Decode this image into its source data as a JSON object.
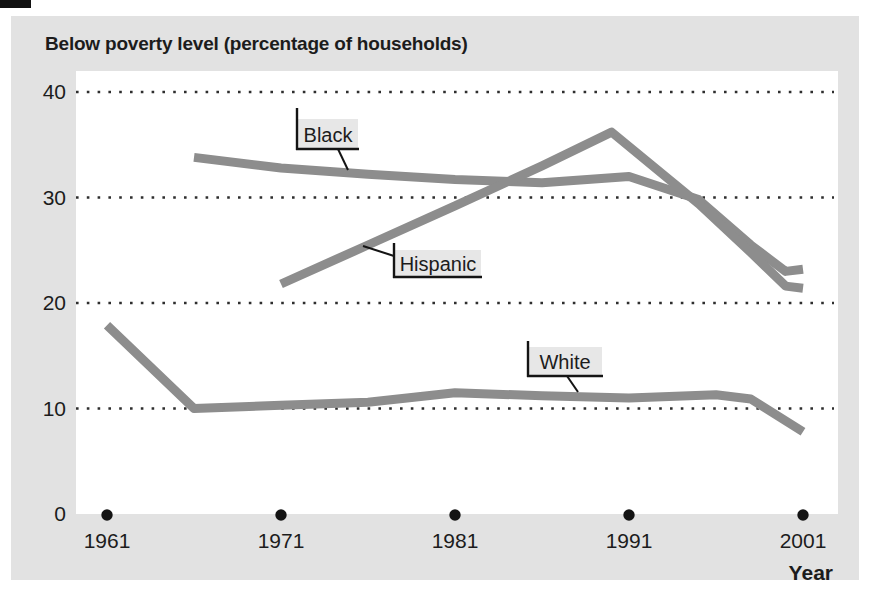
{
  "title": "Below poverty level (percentage of households)",
  "x_axis_label": "Year",
  "colors": {
    "panel_bg": "#e2e2e2",
    "plot_bg": "#ffffff",
    "line_gray": "#8d8d8d",
    "grid_dot": "#2e2e2e",
    "text": "#1c1c1c",
    "callout_bg": "#e7e7e7"
  },
  "y_ticks": [
    "40",
    "30",
    "20",
    "10",
    "0"
  ],
  "x_ticks": [
    "1961",
    "1971",
    "1981",
    "1991",
    "2001"
  ],
  "chart_data": {
    "type": "line",
    "title": "Below poverty level (percentage of households)",
    "xlabel": "Year",
    "ylabel": "Below poverty level (percentage of households)",
    "xlim": [
      1961,
      2001
    ],
    "ylim": [
      0,
      40
    ],
    "x_tick_years": [
      1961,
      1971,
      1981,
      1991,
      2001
    ],
    "y_gridlines": [
      10,
      20,
      30,
      40
    ],
    "grid_style": "dotted",
    "legend_position": "inline-callouts",
    "series": [
      {
        "name": "Black",
        "points": [
          [
            1966,
            33.8
          ],
          [
            1971,
            32.8
          ],
          [
            1976,
            32.2
          ],
          [
            1981,
            31.7
          ],
          [
            1986,
            31.4
          ],
          [
            1991,
            32.0
          ],
          [
            1995,
            29.8
          ],
          [
            1998,
            25.5
          ],
          [
            2000,
            23.0
          ],
          [
            2001,
            23.2
          ]
        ]
      },
      {
        "name": "Hispanic",
        "points": [
          [
            1971,
            21.8
          ],
          [
            1976,
            25.5
          ],
          [
            1981,
            29.2
          ],
          [
            1986,
            33.0
          ],
          [
            1990,
            36.2
          ],
          [
            1995,
            29.4
          ],
          [
            1998,
            24.8
          ],
          [
            2000,
            21.6
          ],
          [
            2001,
            21.4
          ]
        ]
      },
      {
        "name": "White",
        "points": [
          [
            1961,
            17.9
          ],
          [
            1966,
            10.0
          ],
          [
            1971,
            10.3
          ],
          [
            1976,
            10.6
          ],
          [
            1981,
            11.5
          ],
          [
            1986,
            11.2
          ],
          [
            1991,
            11.0
          ],
          [
            1996,
            11.3
          ],
          [
            1998,
            10.9
          ],
          [
            2001,
            7.8
          ]
        ]
      }
    ]
  }
}
